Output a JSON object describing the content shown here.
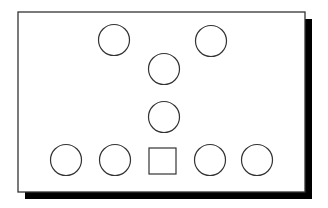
{
  "diagram": {
    "frame": {
      "x": 18,
      "y": 12,
      "width": 287,
      "height": 180,
      "shadow_offset": 7,
      "stroke": "#333333",
      "shadow": "#000000",
      "fill": "#ffffff"
    },
    "shapes": [
      {
        "type": "circle",
        "cx": 114,
        "cy": 40,
        "r": 15.5
      },
      {
        "type": "circle",
        "cx": 211,
        "cy": 41,
        "r": 15.5
      },
      {
        "type": "circle",
        "cx": 164,
        "cy": 69,
        "r": 15.5
      },
      {
        "type": "circle",
        "cx": 164,
        "cy": 117,
        "r": 15.5
      },
      {
        "type": "circle",
        "cx": 66,
        "cy": 160,
        "r": 15.5
      },
      {
        "type": "circle",
        "cx": 115,
        "cy": 160,
        "r": 15.5
      },
      {
        "type": "square",
        "x": 149,
        "y": 148,
        "width": 27,
        "height": 26
      },
      {
        "type": "circle",
        "cx": 210,
        "cy": 160,
        "r": 15.5
      },
      {
        "type": "circle",
        "cx": 257,
        "cy": 160,
        "r": 15.5
      }
    ],
    "stroke_color": "#333333"
  }
}
